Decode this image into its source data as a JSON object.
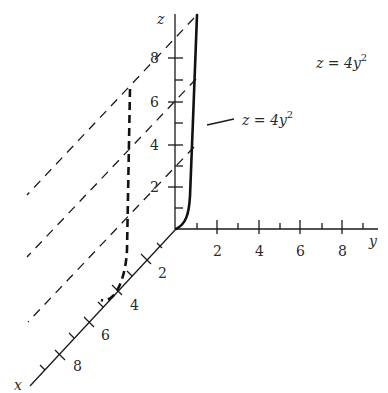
{
  "figure": {
    "axes": {
      "x": {
        "label": "x",
        "tick_labels": [
          "2",
          "4",
          "6",
          "8"
        ]
      },
      "y": {
        "label": "y",
        "tick_labels": [
          "2",
          "4",
          "6",
          "8"
        ]
      },
      "z": {
        "label": "z",
        "tick_labels": [
          "2",
          "4",
          "6",
          "8"
        ]
      }
    },
    "annotations": {
      "curve_label": "z = 4y",
      "curve_label_exp": "2",
      "surface_label": "z = 4y",
      "surface_label_exp": "2"
    },
    "curves": [
      {
        "name": "trace in yz-plane (x=0)",
        "style": "solid",
        "equation": "z = 4y^2"
      },
      {
        "name": "trace translated to x=4",
        "style": "dashed",
        "equation": "z = 4y^2"
      }
    ],
    "rulings": {
      "style": "dashed",
      "count": 3,
      "direction": "parallel to x-axis"
    },
    "colors": {
      "ink": "#1a1a1a",
      "background": "#ffffff"
    }
  }
}
